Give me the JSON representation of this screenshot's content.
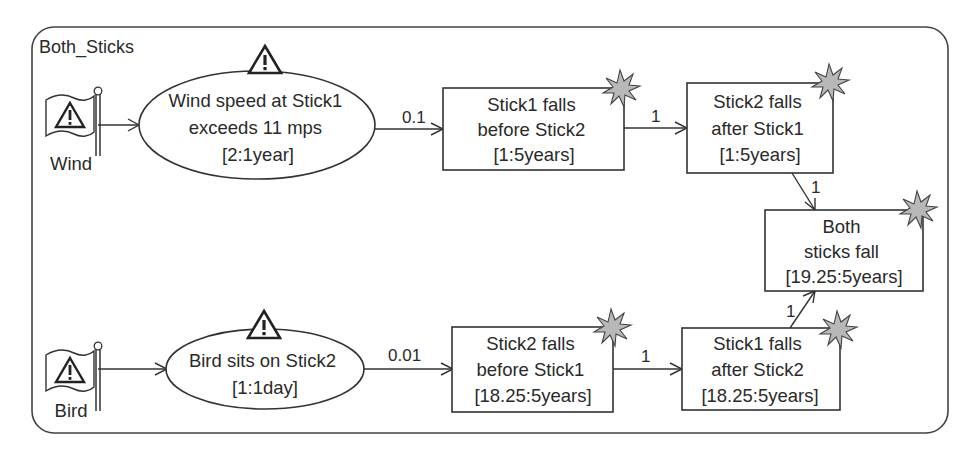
{
  "diagram": {
    "title": "Both_Sticks",
    "triggers": [
      {
        "id": "wind",
        "label": "Wind",
        "icon": "warning-flag-icon"
      },
      {
        "id": "bird",
        "label": "Bird",
        "icon": "warning-flag-icon"
      }
    ],
    "events": [
      {
        "id": "wind_event",
        "lines": [
          "Wind speed at Stick1",
          "exceeds 11 mps",
          "[2:1year]"
        ],
        "icon": "warning-triangle-icon"
      },
      {
        "id": "bird_event",
        "lines": [
          "Bird sits on Stick2",
          "[1:1day]"
        ],
        "icon": "warning-triangle-icon"
      }
    ],
    "outcomes": [
      {
        "id": "s1_before_s2",
        "lines": [
          "Stick1 falls",
          "before Stick2",
          "[1:5years]"
        ],
        "icon": "burst-icon"
      },
      {
        "id": "s2_after_s1",
        "lines": [
          "Stick2 falls",
          "after Stick1",
          "[1:5years]"
        ],
        "icon": "burst-icon"
      },
      {
        "id": "both_fall",
        "lines": [
          "Both",
          "sticks fall",
          "[19.25:5years]"
        ],
        "icon": "burst-icon"
      },
      {
        "id": "s2_before_s1",
        "lines": [
          "Stick2 falls",
          "before Stick1",
          "[18.25:5years]"
        ],
        "icon": "burst-icon"
      },
      {
        "id": "s1_after_s2",
        "lines": [
          "Stick1 falls",
          "after Stick2",
          "[18.25:5years]"
        ],
        "icon": "burst-icon"
      }
    ],
    "edges": [
      {
        "from": "wind",
        "to": "wind_event",
        "label": ""
      },
      {
        "from": "wind_event",
        "to": "s1_before_s2",
        "label": "0.1"
      },
      {
        "from": "s1_before_s2",
        "to": "s2_after_s1",
        "label": "1"
      },
      {
        "from": "s2_after_s1",
        "to": "both_fall",
        "label": "1"
      },
      {
        "from": "bird",
        "to": "bird_event",
        "label": ""
      },
      {
        "from": "bird_event",
        "to": "s2_before_s1",
        "label": "0.01"
      },
      {
        "from": "s2_before_s1",
        "to": "s1_after_s2",
        "label": "1"
      },
      {
        "from": "s1_after_s2",
        "to": "both_fall",
        "label": "1"
      }
    ]
  }
}
